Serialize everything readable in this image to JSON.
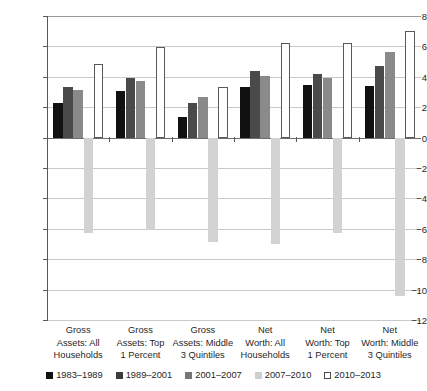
{
  "chart_data": {
    "type": "bar",
    "title": "",
    "xlabel": "",
    "ylabel": "",
    "ylim": [
      -12,
      8
    ],
    "yticks": [
      8,
      6,
      4,
      2,
      0,
      -2,
      -4,
      -6,
      -8,
      -10,
      -12
    ],
    "ytick_labels": [
      "8",
      "6",
      "4",
      "2",
      "0",
      "−2",
      "−4",
      "−6",
      "−8",
      "−10",
      "−12"
    ],
    "grid": true,
    "legend_position": "bottom",
    "categories": [
      "Gross Assets: All Households",
      "Gross Assets: Top 1 Percent",
      "Gross Assets: Middle 3 Quintiles",
      "Net Worth: All Households",
      "Net Worth: Top 1 Percent",
      "Net Worth: Middle 3 Quintiles"
    ],
    "category_lines": [
      [
        "Gross",
        "Assets: All",
        "Households"
      ],
      [
        "Gross",
        "Assets: Top",
        "1 Percent"
      ],
      [
        "Gross",
        "Assets: Middle",
        "3 Quintiles"
      ],
      [
        "Net",
        "Worth: All",
        "Households"
      ],
      [
        "Net",
        "Worth: Top",
        "1 Percent"
      ],
      [
        "Net",
        "Worth: Middle",
        "3 Quintiles"
      ]
    ],
    "series": [
      {
        "name": "1983–1989",
        "color": "#111111",
        "values": [
          2.3,
          3.05,
          1.35,
          3.35,
          3.45,
          3.4
        ]
      },
      {
        "name": "1989–2001",
        "color": "#4a4a4a",
        "values": [
          3.3,
          3.9,
          2.3,
          4.35,
          4.2,
          4.7
        ]
      },
      {
        "name": "2001–2007",
        "color": "#8a8a8a",
        "values": [
          3.1,
          3.75,
          2.7,
          4.05,
          3.95,
          5.6
        ]
      },
      {
        "name": "2007–2010",
        "color": "#d2d2d2",
        "values": [
          -6.3,
          -6.1,
          -6.9,
          -7.0,
          -6.3,
          -10.4
        ]
      },
      {
        "name": "2010–2013",
        "color": "#ffffff",
        "values": [
          4.85,
          5.95,
          3.35,
          6.2,
          6.2,
          7.0
        ]
      }
    ]
  },
  "legend": {
    "items": [
      {
        "label": "1983–1989"
      },
      {
        "label": "1989–2001"
      },
      {
        "label": "2001–2007"
      },
      {
        "label": "2007–2010"
      },
      {
        "label": "2010–2013"
      }
    ]
  },
  "colors": {
    "gridline": "#c9c9c9",
    "axis": "#5a5a5a",
    "text": "#1f1f1f",
    "background": "#ffffff"
  }
}
